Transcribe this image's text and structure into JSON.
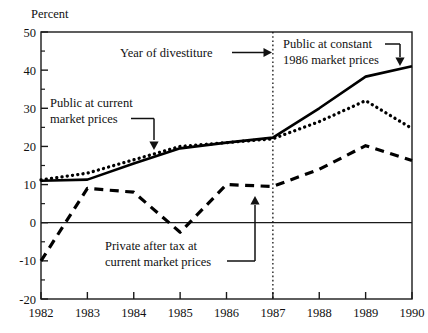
{
  "chart_data": {
    "type": "line",
    "title": "",
    "ylabel": "Percent",
    "xlabel": "",
    "ylim": [
      -20,
      50
    ],
    "xlim": [
      1982,
      1990
    ],
    "yticks": [
      "50",
      "40",
      "30",
      "20",
      "10",
      "0",
      "-10",
      "-20"
    ],
    "ytick_values": [
      50,
      40,
      30,
      20,
      10,
      0,
      -10,
      -20
    ],
    "yminor_values": [
      45,
      35,
      25,
      15,
      5,
      -5,
      -15
    ],
    "xticks": [
      "1982",
      "1983",
      "1984",
      "1985",
      "1986",
      "1987",
      "1988",
      "1989",
      "1990"
    ],
    "xtick_values": [
      1982,
      1983,
      1984,
      1985,
      1986,
      1987,
      1988,
      1989,
      1990
    ],
    "grid": false,
    "legend_position": "inline-annotations",
    "x": [
      1982,
      1983,
      1984,
      1985,
      1986,
      1987,
      1988,
      1989,
      1990
    ],
    "series": [
      {
        "name": "Public at constant 1986 market prices",
        "style": "solid",
        "color": "#000000",
        "values": [
          11,
          11.3,
          15.5,
          19.5,
          21,
          22.3,
          30,
          38.3,
          41
        ]
      },
      {
        "name": "Public at current market prices",
        "style": "dotted",
        "color": "#000000",
        "values": [
          11.2,
          13,
          16.5,
          20,
          21,
          22,
          26.5,
          32,
          24.7
        ]
      },
      {
        "name": "Private after tax at current market prices",
        "style": "dashed",
        "color": "#000000",
        "values": [
          -10,
          9,
          8,
          -2.5,
          10,
          9.5,
          14,
          20.2,
          16.3
        ]
      }
    ],
    "annotations": [
      {
        "id": "year-of-divestiture",
        "text": "Year of divestiture",
        "points_to_x": 1987,
        "arrow": "right"
      },
      {
        "id": "public-constant",
        "text_line1": "Public at constant",
        "text_line2": "1986 market prices",
        "points_to_series": "Public at constant 1986 market prices",
        "arrow": "down"
      },
      {
        "id": "public-current",
        "text_line1": "Public at current",
        "text_line2": "market prices",
        "points_to_series": "Public at current market prices",
        "arrow": "down"
      },
      {
        "id": "private-after-tax",
        "text_line1": "Private after tax at",
        "text_line2": "current market prices",
        "points_to_series": "Private after tax at current market prices",
        "arrow": "up"
      }
    ],
    "vertical_reference_line": {
      "x": 1987,
      "style": "dotted",
      "label": "Year of divestiture"
    },
    "zero_line": true
  },
  "axis": {
    "y_title": "Percent"
  },
  "annotations_text": {
    "divestiture": "Year of divestiture",
    "public_constant_l1": "Public at constant",
    "public_constant_l2": "1986 market prices",
    "public_current_l1": "Public at current",
    "public_current_l2": "market prices",
    "private_l1": "Private after tax at",
    "private_l2": "current market prices"
  },
  "ticks": {
    "y": [
      "50",
      "40",
      "30",
      "20",
      "10",
      "0",
      "-10",
      "-20"
    ],
    "x": [
      "1982",
      "1983",
      "1984",
      "1985",
      "1986",
      "1987",
      "1988",
      "1989",
      "1990"
    ]
  },
  "colors": {
    "ink": "#000000",
    "background": "#ffffff",
    "frame": "#1a1a1a"
  }
}
